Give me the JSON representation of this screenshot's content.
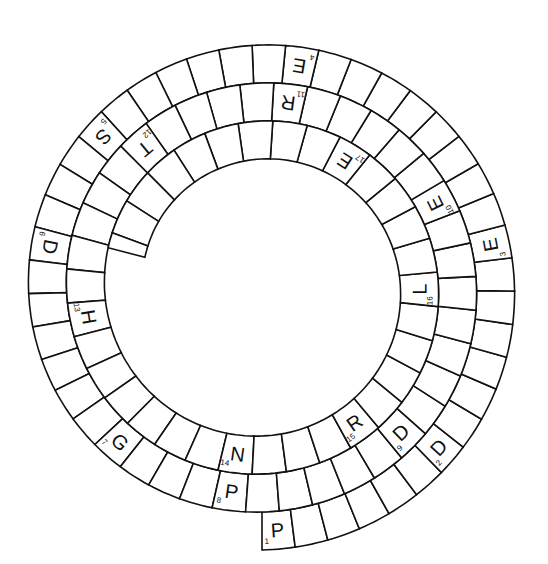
{
  "puzzle": {
    "type": "spiral-word-puzzle",
    "center": [
      262,
      288
    ],
    "start_angle_deg": 90,
    "turns_description": "Spiral runs clockwise from bottom (cell 1) inward to top center",
    "ring_width": 38,
    "outer_radius": 262,
    "inner_radius": 122,
    "cells_per_turn_outer": 36,
    "total_cells": 96,
    "clues": [
      {
        "number": "1",
        "letter": "P",
        "cell": 0
      },
      {
        "number": "2",
        "letter": "D",
        "cell": 6
      },
      {
        "number": "3",
        "letter": "E",
        "cell": 13
      },
      {
        "number": "4",
        "letter": "E",
        "cell": 22
      },
      {
        "number": "5",
        "letter": "S",
        "cell": 29
      },
      {
        "number": "6",
        "letter": "D",
        "cell": 33
      },
      {
        "number": "7",
        "letter": "G",
        "cell": 40
      },
      {
        "number": "8",
        "letter": "P",
        "cell": 44
      },
      {
        "number": "9",
        "letter": "D",
        "cell": 50
      },
      {
        "number": "10",
        "letter": "E",
        "cell": 58
      },
      {
        "number": "11",
        "letter": "R",
        "cell": 64
      },
      {
        "number": "12",
        "letter": "T",
        "cell": 69
      },
      {
        "number": "13",
        "letter": "H",
        "cell": 75
      },
      {
        "number": "14",
        "letter": "N",
        "cell": 82
      },
      {
        "number": "15",
        "letter": "R",
        "cell": 86
      },
      {
        "number": "16",
        "letter": "L",
        "cell": 91
      },
      {
        "number": "17",
        "letter": "E",
        "cell": 96
      }
    ]
  }
}
